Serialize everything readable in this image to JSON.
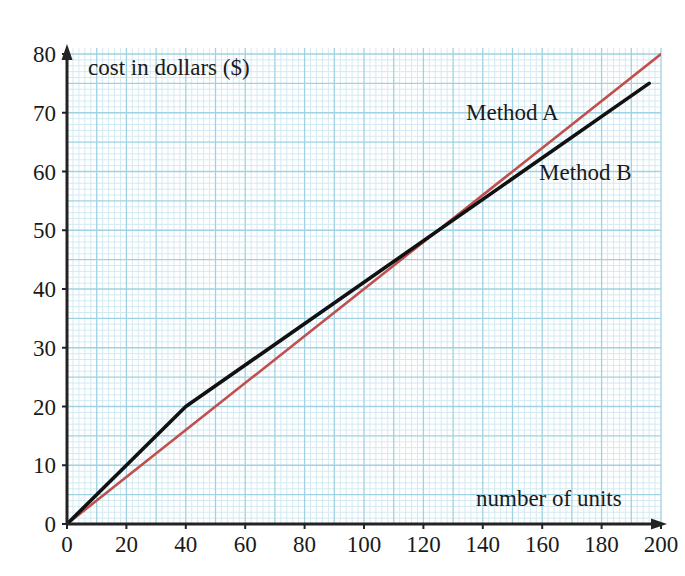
{
  "chart_data": {
    "type": "line",
    "title": "",
    "xlabel": "number of units",
    "ylabel": "cost in dollars ($)",
    "xlim": [
      0,
      200
    ],
    "ylim": [
      0,
      80
    ],
    "xticks": [
      0,
      20,
      40,
      60,
      80,
      100,
      120,
      140,
      160,
      180,
      200
    ],
    "yticks": [
      0,
      10,
      20,
      30,
      40,
      50,
      60,
      70,
      80
    ],
    "xtick_labels": [
      "0",
      "20",
      "40",
      "60",
      "80",
      "100",
      "120",
      "140",
      "160",
      "180",
      "200"
    ],
    "ytick_labels": [
      "0",
      "10",
      "20",
      "30",
      "40",
      "50",
      "60",
      "70",
      "80"
    ],
    "grid": true,
    "grid_minor_step_x": 2,
    "grid_minor_step_y": 1,
    "grid_major_step_x": 10,
    "grid_major_step_y": 5,
    "legend_position": "inline-annotation",
    "series": [
      {
        "name": "Method A",
        "color": "#c0504d",
        "label_x": 466,
        "label_y": 101,
        "points": [
          {
            "x": 0,
            "y": 0
          },
          {
            "x": 200,
            "y": 80
          }
        ]
      },
      {
        "name": "Method B",
        "color": "#111111",
        "label_x": 539,
        "label_y": 161,
        "points": [
          {
            "x": 0,
            "y": 0
          },
          {
            "x": 40,
            "y": 20
          },
          {
            "x": 196,
            "y": 75
          }
        ]
      }
    ],
    "annotations": [
      {
        "text": "Method A",
        "series": "Method A"
      },
      {
        "text": "Method B",
        "series": "Method B"
      }
    ],
    "colors": {
      "method_a": "#c0504d",
      "method_b": "#111111",
      "grid_minor": "#cfe8f0",
      "grid_major": "#9fd2e2",
      "axis": "#232323",
      "background": "#ffffff"
    }
  },
  "axes": {
    "x_title": "number of units",
    "y_title": "cost in dollars ($)"
  }
}
